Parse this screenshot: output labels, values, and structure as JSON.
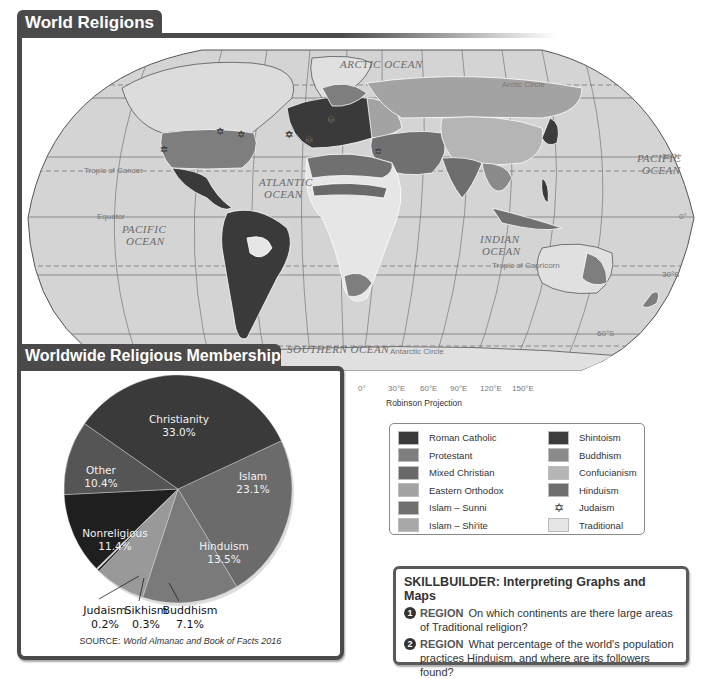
{
  "map": {
    "title": "World Religions",
    "projection": "Robinson Projection",
    "ocean_labels": {
      "arctic": "ARCTIC OCEAN",
      "pacific_west_1": "PACIFIC",
      "pacific_west_2": "OCEAN",
      "atlantic_1": "ATLANTIC",
      "atlantic_2": "OCEAN",
      "indian_1": "INDIAN",
      "indian_2": "OCEAN",
      "pacific_east_1": "PACIFIC",
      "pacific_east_2": "OCEAN",
      "southern": "SOUTHERN OCEAN"
    },
    "line_labels": {
      "arctic_circle": "Arctic Circle",
      "tropic_cancer": "Tropic of Cancer",
      "equator": "Equator",
      "tropic_capricorn": "Tropic of Capricorn",
      "antarctic_circle": "Antarctic Circle"
    },
    "latitude_labels": [
      "30°N",
      "0°",
      "30°S",
      "60°S"
    ],
    "longitude_labels": [
      "0°",
      "30°E",
      "60°E",
      "90°E",
      "120°E",
      "150°E"
    ]
  },
  "pie_panel": {
    "title": "Worldwide Religious Membership",
    "source_prefix": "SOURCE: ",
    "source_title": "World Almanac and Book of Facts 2016"
  },
  "chart_data": {
    "type": "pie",
    "title": "Worldwide Religious Membership",
    "source": "World Almanac and Book of Facts 2016",
    "unit": "%",
    "slices": [
      {
        "label": "Christianity",
        "value": 33.0,
        "display": "33.0%",
        "color": "#3a3a3a"
      },
      {
        "label": "Islam",
        "value": 23.1,
        "display": "23.1%",
        "color": "#6b6b6b"
      },
      {
        "label": "Hinduism",
        "value": 13.5,
        "display": "13.5%",
        "color": "#7a7a7a"
      },
      {
        "label": "Buddhism",
        "value": 7.1,
        "display": "7.1%",
        "color": "#999999"
      },
      {
        "label": "Sikhism",
        "value": 0.3,
        "display": "0.3%",
        "color": "#2a2a2a"
      },
      {
        "label": "Judaism",
        "value": 0.2,
        "display": "0.2%",
        "color": "#d8d8d8"
      },
      {
        "label": "Nonreligious",
        "value": 11.4,
        "display": "11.4%",
        "color": "#1f1f1f"
      },
      {
        "label": "Other",
        "value": 10.4,
        "display": "10.4%",
        "color": "#555555"
      }
    ]
  },
  "legend": {
    "left": [
      {
        "label": "Roman Catholic",
        "color": "#3a3a3a"
      },
      {
        "label": "Protestant",
        "color": "#7e7e7e"
      },
      {
        "label": "Mixed Christian",
        "color": "#6a6a6a"
      },
      {
        "label": "Eastern Orthodox",
        "color": "#a3a3a3"
      },
      {
        "label": "Islam – Sunni",
        "color": "#707070"
      },
      {
        "label": "Islam – Shi'ite",
        "color": "#a8a8a8"
      }
    ],
    "right": [
      {
        "label": "Shintoism",
        "color": "#3c3c3c"
      },
      {
        "label": "Buddhism",
        "color": "#8a8a8a"
      },
      {
        "label": "Confucianism",
        "color": "#b5b5b5"
      },
      {
        "label": "Hinduism",
        "color": "#6e6e6e"
      },
      {
        "label": "Judaism",
        "symbol": "✡"
      },
      {
        "label": "Traditional",
        "color": "#e6e6e6"
      }
    ]
  },
  "skillbuilder": {
    "title": "SKILLBUILDER: Interpreting Graphs and Maps",
    "questions": [
      {
        "num": "1",
        "keyword": "REGION",
        "text": "On which continents are there large areas of Traditional religion?"
      },
      {
        "num": "2",
        "keyword": "REGION",
        "text": "What percentage of the world's population practices Hinduism, and where are its followers found?"
      }
    ]
  }
}
